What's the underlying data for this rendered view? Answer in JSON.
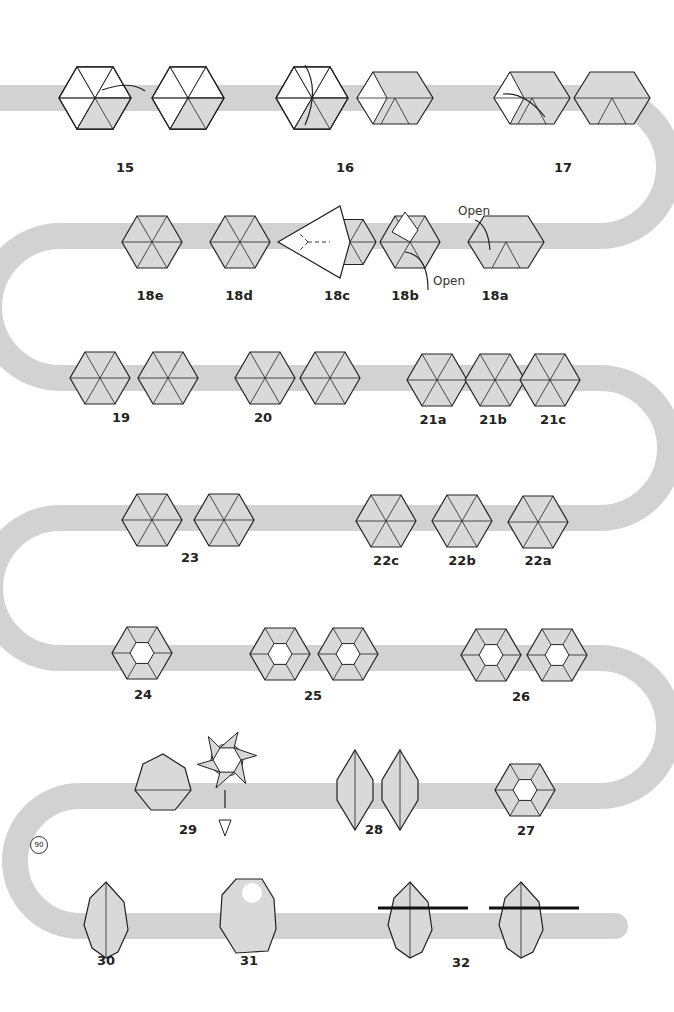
{
  "colors": {
    "path": "#d2d2d2",
    "paper_colored": "#d9d9d9",
    "paper_white": "#ffffff",
    "stroke": "#222222",
    "background": "#ffffff"
  },
  "path": {
    "width": 26,
    "rows_y": [
      98,
      236,
      378,
      518,
      658,
      796,
      926
    ]
  },
  "steps": [
    {
      "id": "15",
      "label": "15",
      "x": 125,
      "y": 170,
      "figures": [
        {
          "x": 95,
          "y": 98,
          "type": "hex-mixed",
          "note": "valley fold arrow"
        },
        {
          "x": 188,
          "y": 98,
          "type": "hex-mixed"
        }
      ]
    },
    {
      "id": "16",
      "label": "16",
      "x": 345,
      "y": 170,
      "figures": [
        {
          "x": 312,
          "y": 98,
          "type": "hex-mixed",
          "note": "fold down arrow"
        },
        {
          "x": 395,
          "y": 98,
          "type": "rhombus"
        }
      ]
    },
    {
      "id": "17",
      "label": "17",
      "x": 563,
      "y": 170,
      "figures": [
        {
          "x": 532,
          "y": 98,
          "type": "rhombus",
          "note": "fold arrow"
        },
        {
          "x": 612,
          "y": 98,
          "type": "parallelogram"
        }
      ]
    },
    {
      "id": "18a",
      "label": "18a",
      "x": 495,
      "y": 298,
      "figures": [
        {
          "x": 506,
          "y": 242,
          "type": "parallelogram"
        }
      ]
    },
    {
      "id": "18b",
      "label": "18b",
      "x": 405,
      "y": 298,
      "figures": [
        {
          "x": 410,
          "y": 242,
          "type": "hex-open"
        }
      ]
    },
    {
      "id": "18c",
      "label": "18c",
      "x": 337,
      "y": 298,
      "figures": [
        {
          "x": 330,
          "y": 242,
          "type": "kite"
        }
      ]
    },
    {
      "id": "18d",
      "label": "18d",
      "x": 239,
      "y": 298,
      "figures": [
        {
          "x": 240,
          "y": 242,
          "type": "hex-colored"
        }
      ]
    },
    {
      "id": "18e",
      "label": "18e",
      "x": 150,
      "y": 298,
      "figures": [
        {
          "x": 152,
          "y": 242,
          "type": "hex-colored"
        }
      ]
    },
    {
      "id": "19",
      "label": "19",
      "x": 121,
      "y": 420,
      "figures": [
        {
          "x": 100,
          "y": 378,
          "type": "hex-colored"
        },
        {
          "x": 168,
          "y": 378,
          "type": "hex-colored"
        }
      ]
    },
    {
      "id": "20",
      "label": "20",
      "x": 263,
      "y": 420,
      "figures": [
        {
          "x": 265,
          "y": 378,
          "type": "hex-colored"
        },
        {
          "x": 330,
          "y": 378,
          "type": "hex-colored"
        }
      ]
    },
    {
      "id": "21a",
      "label": "21a",
      "x": 433,
      "y": 422,
      "figures": [
        {
          "x": 437,
          "y": 380,
          "type": "hex-colored"
        }
      ]
    },
    {
      "id": "21b",
      "label": "21b",
      "x": 493,
      "y": 422,
      "figures": [
        {
          "x": 495,
          "y": 380,
          "type": "hex-colored"
        }
      ]
    },
    {
      "id": "21c",
      "label": "21c",
      "x": 553,
      "y": 422,
      "figures": [
        {
          "x": 550,
          "y": 380,
          "type": "hex-colored"
        }
      ]
    },
    {
      "id": "22a",
      "label": "22a",
      "x": 538,
      "y": 563,
      "figures": [
        {
          "x": 538,
          "y": 522,
          "type": "hex-colored"
        }
      ]
    },
    {
      "id": "22b",
      "label": "22b",
      "x": 462,
      "y": 563,
      "figures": [
        {
          "x": 462,
          "y": 521,
          "type": "hex-colored"
        }
      ]
    },
    {
      "id": "22c",
      "label": "22c",
      "x": 386,
      "y": 563,
      "figures": [
        {
          "x": 386,
          "y": 521,
          "type": "hex-colored"
        }
      ]
    },
    {
      "id": "23",
      "label": "23",
      "x": 190,
      "y": 560,
      "figures": [
        {
          "x": 152,
          "y": 520,
          "type": "hex-colored"
        },
        {
          "x": 224,
          "y": 520,
          "type": "hex-colored"
        }
      ]
    },
    {
      "id": "24",
      "label": "24",
      "x": 143,
      "y": 697,
      "figures": [
        {
          "x": 142,
          "y": 653,
          "type": "hex-center-open"
        }
      ]
    },
    {
      "id": "25",
      "label": "25",
      "x": 313,
      "y": 698,
      "figures": [
        {
          "x": 280,
          "y": 654,
          "type": "hex-center-open"
        },
        {
          "x": 348,
          "y": 654,
          "type": "hex-center-open"
        }
      ]
    },
    {
      "id": "26",
      "label": "26",
      "x": 521,
      "y": 699,
      "figures": [
        {
          "x": 491,
          "y": 655,
          "type": "hex-center-open"
        },
        {
          "x": 557,
          "y": 655,
          "type": "hex-center-open"
        }
      ]
    },
    {
      "id": "27",
      "label": "27",
      "x": 526,
      "y": 833,
      "figures": [
        {
          "x": 525,
          "y": 790,
          "type": "hex-center-open"
        }
      ]
    },
    {
      "id": "28",
      "label": "28",
      "x": 374,
      "y": 832,
      "figures": [
        {
          "x": 355,
          "y": 790,
          "type": "squeezed"
        },
        {
          "x": 400,
          "y": 790,
          "type": "squeezed"
        }
      ]
    },
    {
      "id": "29",
      "label": "29",
      "x": 188,
      "y": 832,
      "figures": [
        {
          "x": 163,
          "y": 780,
          "type": "ball"
        },
        {
          "x": 227,
          "y": 760,
          "type": "star"
        }
      ]
    },
    {
      "id": "30",
      "label": "30",
      "x": 106,
      "y": 963,
      "figures": [
        {
          "x": 106,
          "y": 920,
          "type": "egg"
        }
      ]
    },
    {
      "id": "31",
      "label": "31",
      "x": 249,
      "y": 963,
      "figures": [
        {
          "x": 248,
          "y": 915,
          "type": "ball-open"
        }
      ]
    },
    {
      "id": "32",
      "label": "32",
      "x": 461,
      "y": 965,
      "figures": [
        {
          "x": 410,
          "y": 920,
          "type": "egg",
          "skewer": true
        },
        {
          "x": 521,
          "y": 920,
          "type": "egg",
          "skewer": true
        }
      ]
    }
  ],
  "annotations": {
    "open_top": "Open",
    "open_bottom": "Open",
    "rotate_symbol": "90"
  }
}
